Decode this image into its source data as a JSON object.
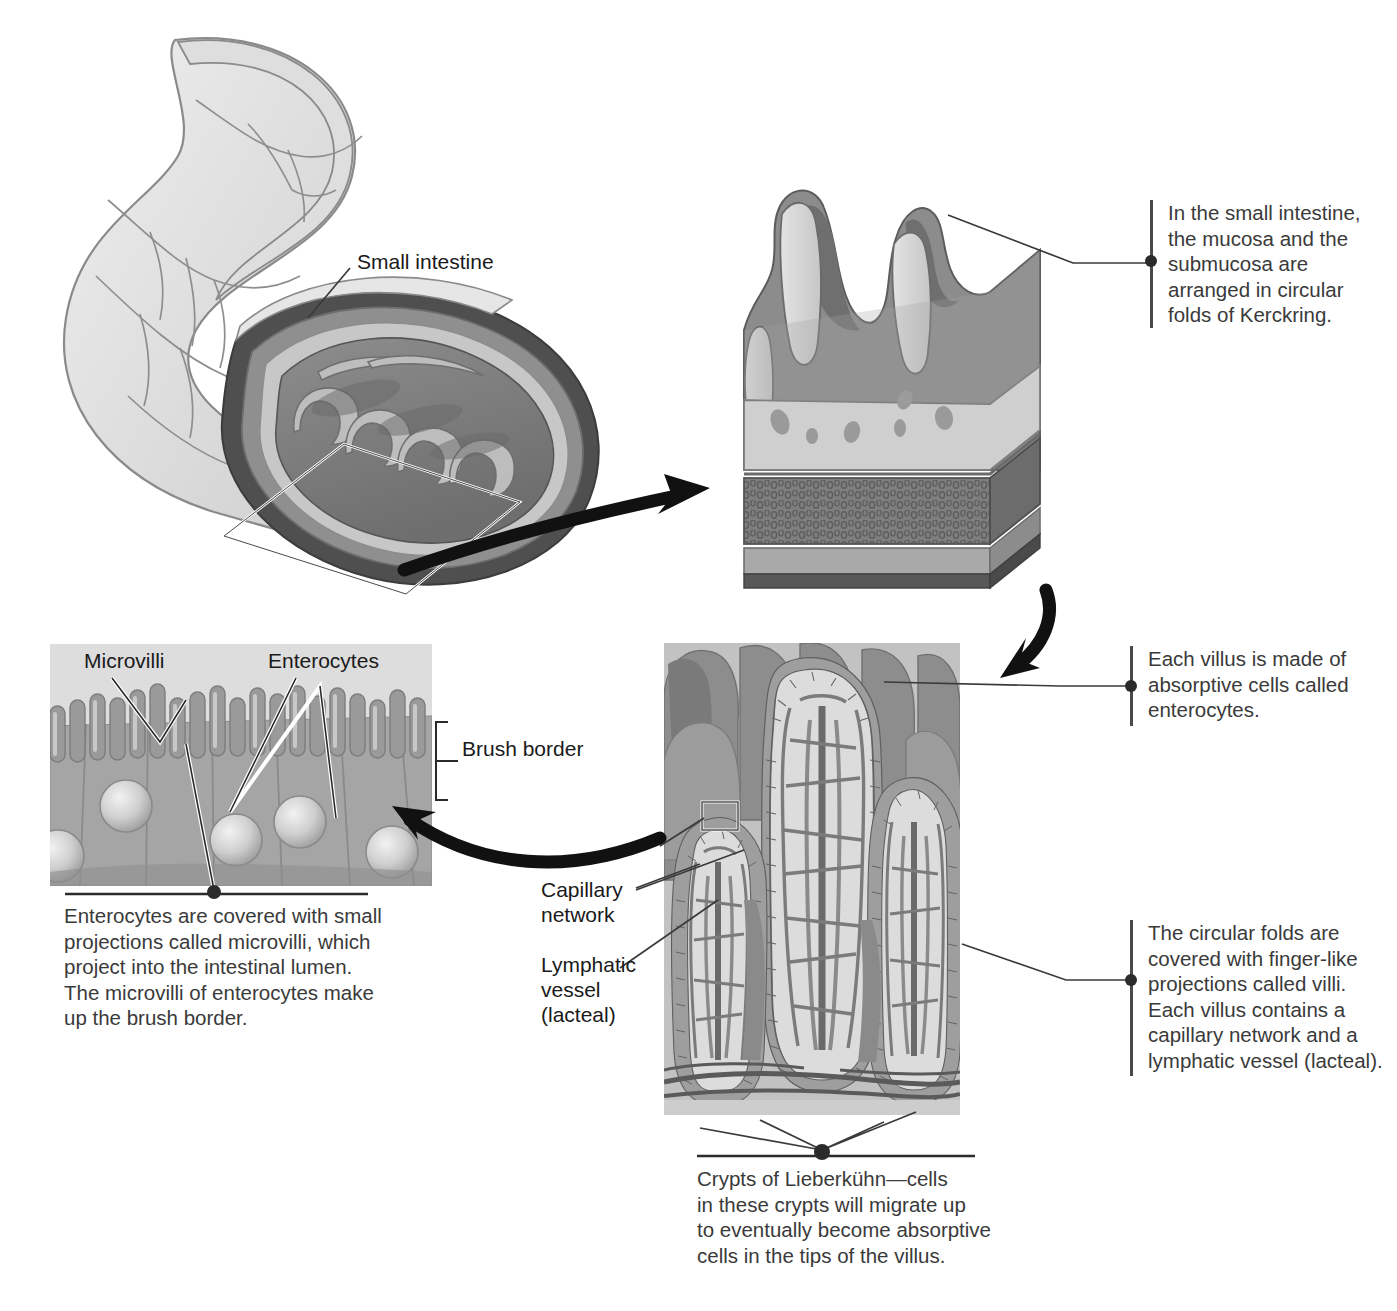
{
  "figure": {
    "colors": {
      "ink": "#231f20",
      "text_gray": "#3a3a3a",
      "tissue_light": "#d9d9d9",
      "tissue_mid": "#a8a8a8",
      "tissue_dark": "#7c7c7c",
      "tissue_darkest": "#5e5e5e",
      "panel_bg": "#cfcfcf",
      "arrow": "#1a1a1a"
    }
  },
  "labels": {
    "small_intestine": "Small intestine",
    "microvilli": "Microvilli",
    "enterocytes": "Enterocytes",
    "brush_border": "Brush border",
    "capillary_network": "Capillary\nnetwork",
    "lymphatic_vessel": "Lymphatic\nvessel\n(lacteal)"
  },
  "callouts": {
    "kerckring": "In the small intestine,\nthe mucosa and the\nsubmucosa are\narranged in circular\nfolds of Kerckring.",
    "enterocytes": "Each villus is made of\nabsorptive cells called\nenterocytes.",
    "villi": "The circular folds are\ncovered with finger-like\nprojections called villi.\nEach villus contains a\ncapillary network and a\nlymphatic vessel (lacteal)."
  },
  "captions": {
    "microvilli": "Enterocytes are covered with small\nprojections called microvilli, which\nproject into the intestinal lumen.\nThe microvilli of enterocytes make\nup the brush border.",
    "crypts": "Crypts of Lieberkühn—cells\nin these crypts will migrate up\nto eventually become absorptive\ncells in the tips of the villus."
  },
  "icons": {
    "arrow_fold": "curved-arrow-icon",
    "arrow_villus": "curved-arrow-icon",
    "arrow_microvilli": "curved-arrow-icon",
    "leader": "leader-line-icon",
    "bracket": "bracket-icon"
  }
}
